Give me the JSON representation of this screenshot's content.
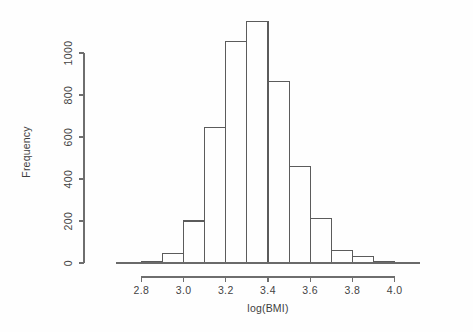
{
  "chart_data": {
    "type": "bar",
    "subtype": "histogram",
    "title": "",
    "xlabel": "log(BMI)",
    "ylabel": "Frequency",
    "xlim": [
      2.68,
      4.12
    ],
    "ylim": [
      0,
      1180
    ],
    "grid": false,
    "legend": null,
    "bin_width": 0.1,
    "x_ticks": [
      2.8,
      3.0,
      3.2,
      3.4,
      3.6,
      3.8,
      4.0
    ],
    "x_tick_labels": [
      "2.8",
      "3.0",
      "3.2",
      "3.4",
      "3.6",
      "3.8",
      "4.0"
    ],
    "y_ticks": [
      0,
      200,
      400,
      600,
      800,
      1000
    ],
    "y_tick_labels": [
      "0",
      "200",
      "400",
      "600",
      "800",
      "1000"
    ],
    "bins": [
      {
        "left": 2.7,
        "right": 2.8,
        "count": 2
      },
      {
        "left": 2.8,
        "right": 2.9,
        "count": 5
      },
      {
        "left": 2.9,
        "right": 3.0,
        "count": 45
      },
      {
        "left": 3.0,
        "right": 3.1,
        "count": 200
      },
      {
        "left": 3.1,
        "right": 3.2,
        "count": 645
      },
      {
        "left": 3.2,
        "right": 3.3,
        "count": 1055
      },
      {
        "left": 3.3,
        "right": 3.4,
        "count": 1150
      },
      {
        "left": 3.4,
        "right": 3.5,
        "count": 865
      },
      {
        "left": 3.5,
        "right": 3.6,
        "count": 460
      },
      {
        "left": 3.6,
        "right": 3.7,
        "count": 210
      },
      {
        "left": 3.7,
        "right": 3.8,
        "count": 60
      },
      {
        "left": 3.8,
        "right": 3.9,
        "count": 30
      },
      {
        "left": 3.9,
        "right": 4.0,
        "count": 5
      },
      {
        "left": 4.0,
        "right": 4.1,
        "count": 2
      }
    ],
    "categories": [
      "2.70-2.80",
      "2.80-2.90",
      "2.90-3.00",
      "3.00-3.10",
      "3.10-3.20",
      "3.20-3.30",
      "3.30-3.40",
      "3.40-3.50",
      "3.50-3.60",
      "3.60-3.70",
      "3.70-3.80",
      "3.80-3.90",
      "3.90-4.00",
      "4.00-4.10"
    ],
    "values": [
      2,
      5,
      45,
      200,
      645,
      1055,
      1150,
      865,
      460,
      210,
      60,
      30,
      5,
      2
    ],
    "colors": {
      "bar_stroke": "#5b5b5b",
      "bar_fill": "none",
      "axis": "#6e6e6e",
      "text": "#3d3d3d",
      "background": "#fefefe"
    }
  }
}
